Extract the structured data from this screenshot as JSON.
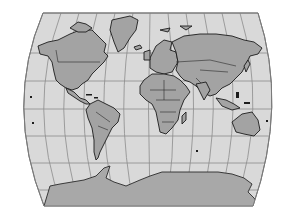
{
  "map": {
    "projection": "world-map-graticule",
    "colors": {
      "ocean": "#d9d9d9",
      "land": "#a3a3a3",
      "coastline": "#1c1c1c",
      "graticule": "#8c8c8c",
      "background": "#ffffff"
    },
    "regions": [
      {
        "name": "North America"
      },
      {
        "name": "Greenland"
      },
      {
        "name": "South America"
      },
      {
        "name": "Europe"
      },
      {
        "name": "Africa"
      },
      {
        "name": "Asia"
      },
      {
        "name": "Australia"
      },
      {
        "name": "Antarctica"
      }
    ]
  }
}
